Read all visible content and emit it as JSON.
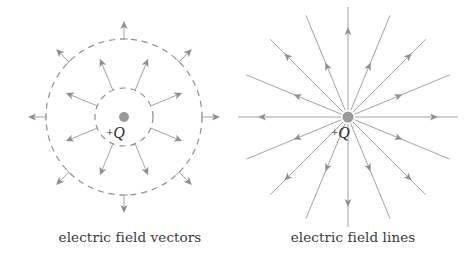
{
  "colors": {
    "line": "#a3a3a3",
    "arrow": "#8f8f8f",
    "dash": "#8f8f8f",
    "charge": "#9a9a9a",
    "text": "#3a3a3a"
  },
  "panels": [
    {
      "id": "vectors",
      "caption": "electric field vectors",
      "caption_x": 130,
      "charge": {
        "cx": 124,
        "cy": 117,
        "r": 5,
        "plus": "+",
        "symbol": "Q",
        "label_x": 106,
        "label_y": 124
      },
      "circles": [
        {
          "r": 29,
          "dash": "6 5"
        },
        {
          "r": 78,
          "dash": "6 5"
        }
      ],
      "inner_vectors": {
        "angles_deg": [
          22.5,
          67.5,
          112.5,
          157.5,
          202.5,
          247.5,
          292.5,
          337.5
        ],
        "r_start": 29,
        "r_end": 63
      },
      "outer_vectors": {
        "angles_deg": [
          0,
          45,
          90,
          135,
          180,
          225,
          270,
          315
        ],
        "r_start": 78,
        "r_end": 96,
        "tick_half": 4
      }
    },
    {
      "id": "lines",
      "caption": "electric field lines",
      "caption_x": 353,
      "charge": {
        "cx": 348,
        "cy": 117,
        "r": 5.5,
        "plus": "+",
        "symbol": "Q",
        "label_x": 331,
        "label_y": 124
      },
      "field_lines": {
        "angles_deg": [
          0,
          22.5,
          45,
          67.5,
          90,
          112.5,
          135,
          157.5,
          180,
          202.5,
          225,
          247.5,
          270,
          292.5,
          315,
          337.5
        ],
        "r_start": 7,
        "r_end": 110,
        "arrow_r_major": 90,
        "arrow_r_minor": 59
      }
    }
  ]
}
